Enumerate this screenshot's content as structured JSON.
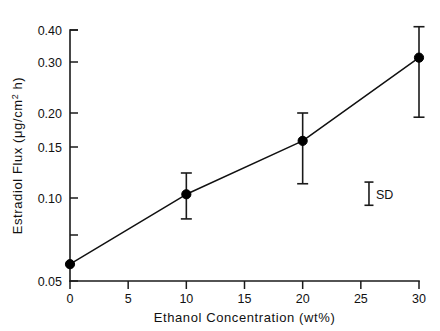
{
  "chart_data": {
    "type": "line",
    "title": "",
    "xlabel": "Ethanol Concentration  (wt%)",
    "ylabel": "Estradiol Flux  (μg/cm² h)",
    "ylabel_parts": {
      "prefix": "Estradiol Flux  (μg/cm",
      "superscript": "2",
      "suffix": " h)"
    },
    "x": [
      0,
      10,
      20,
      30
    ],
    "values": [
      0.058,
      0.103,
      0.158,
      0.312
    ],
    "series": [
      {
        "name": "Estradiol flux",
        "x": [
          0,
          10,
          20,
          30
        ],
        "values": [
          0.058,
          0.103,
          0.158,
          0.312
        ],
        "err_low": [
          0.058,
          0.085,
          0.112,
          0.193
        ],
        "err_high": [
          0.058,
          0.122,
          0.2,
          0.412
        ],
        "has_error_bars": [
          false,
          true,
          true,
          true
        ],
        "marker": "filled-circle",
        "line_color": "#111111"
      }
    ],
    "xlim": [
      0,
      30
    ],
    "ylim": [
      0.05,
      0.4
    ],
    "xticks": [
      0,
      5,
      10,
      15,
      20,
      25,
      30
    ],
    "xtick_labels": [
      "0",
      "5",
      "10",
      "15",
      "20",
      "25",
      "30"
    ],
    "yticks": [
      0.05,
      0.075,
      0.1,
      0.15,
      0.2,
      0.3,
      0.4
    ],
    "ytick_labels": [
      "0.05",
      "",
      "0.10",
      "0.15",
      "0.20",
      "0.30",
      "0.40"
    ],
    "y_scale": "nonlinear-log-like",
    "grid": false,
    "legend_position": "inside-right",
    "annotations": [
      {
        "name": "sd-marker",
        "label": "SD",
        "type": "error-bar-legend",
        "x_value": 25.7,
        "y_top": 0.1135,
        "y_bottom": 0.0945
      }
    ]
  },
  "axes": {
    "y_axis_name": "estradiol-flux-axis",
    "x_axis_name": "ethanol-concentration-axis"
  }
}
